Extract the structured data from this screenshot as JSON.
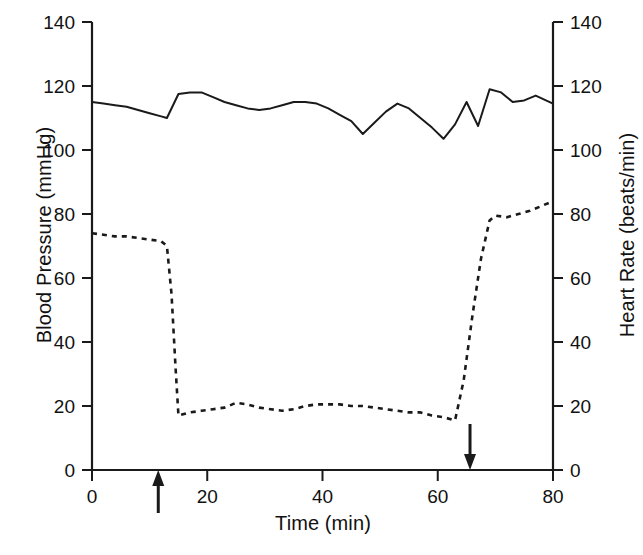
{
  "chart_data": {
    "type": "line",
    "title": "",
    "xlabel": "Time (min)",
    "ylabel": "Blood Pressure (mmHg)",
    "ylabel_right": "Heart Rate (beats/min)",
    "xlim": [
      0,
      80
    ],
    "ylim": [
      0,
      140
    ],
    "ylim_right": [
      0,
      140
    ],
    "xticks": [
      0,
      20,
      40,
      60,
      80
    ],
    "xticklabels": [
      "0",
      "20",
      "40",
      "60",
      "80"
    ],
    "yticks": [
      0,
      20,
      40,
      60,
      80,
      100,
      120,
      140
    ],
    "yticklabels": [
      "0",
      "20",
      "40",
      "60",
      "80",
      "100",
      "120",
      "140"
    ],
    "yticks_right": [
      0,
      20,
      40,
      60,
      80,
      100,
      120,
      140
    ],
    "yticklabels_right": [
      "0",
      "20",
      "40",
      "60",
      "80",
      "100",
      "120",
      "140"
    ],
    "grid": false,
    "legend": false,
    "legend_position": "none",
    "series": [
      {
        "name": "Blood Pressure (mmHg)",
        "axis": "left",
        "style": "solid",
        "color": "#1a1a1a",
        "x": [
          0,
          2,
          4,
          6,
          8,
          10,
          12,
          13,
          15,
          17,
          19,
          21,
          23,
          25,
          27,
          29,
          31,
          33,
          35,
          37,
          39,
          41,
          43,
          45,
          47,
          49,
          51,
          53,
          55,
          57,
          59,
          61,
          63,
          65,
          67,
          69,
          71,
          73,
          75,
          77,
          80
        ],
        "values": [
          115,
          114.5,
          114,
          113.5,
          112.5,
          111.5,
          110.5,
          110,
          117.5,
          118,
          118,
          116.5,
          115,
          114,
          113,
          112.5,
          113,
          114,
          115,
          115,
          114.5,
          113,
          111,
          109,
          105,
          108.5,
          112,
          114.5,
          113,
          110,
          107,
          103.5,
          108,
          115,
          107.5,
          119,
          118,
          115,
          115.5,
          117,
          114.5
        ]
      },
      {
        "name": "Heart Rate (beats/min)",
        "axis": "right",
        "style": "dashed",
        "color": "#1a1a1a",
        "x": [
          0,
          2,
          4,
          6,
          8,
          10,
          12,
          13,
          13.8,
          14.5,
          15,
          17,
          19,
          21,
          23,
          25,
          27,
          29,
          31,
          33,
          35,
          37,
          39,
          41,
          43,
          45,
          47,
          49,
          51,
          53,
          55,
          57,
          59,
          61,
          63,
          64.5,
          66,
          67.5,
          69,
          70,
          72,
          74,
          76,
          78,
          80
        ],
        "values": [
          74,
          73.5,
          73,
          73,
          72.5,
          72,
          71.5,
          70,
          55,
          32,
          17,
          18,
          18.5,
          19,
          19.5,
          21,
          20.5,
          19.5,
          19,
          18.5,
          19,
          20,
          20.5,
          20.5,
          20.5,
          20,
          20,
          19.5,
          19,
          18.5,
          18,
          18,
          17,
          16.5,
          15.5,
          28,
          48,
          66,
          78,
          79.5,
          79,
          80,
          81,
          82.5,
          84
        ]
      }
    ],
    "annotations": [
      {
        "name": "drug-administration-marker",
        "type": "arrow-up",
        "x": 11.5,
        "label": ""
      },
      {
        "name": "drug-withdrawal-marker",
        "type": "arrow-down",
        "x": 65.6,
        "label": ""
      }
    ]
  },
  "axes": {
    "left_title": "Blood Pressure (mmHg)",
    "right_title": "Heart Rate (beats/min)",
    "x_title": "Time (min)"
  }
}
